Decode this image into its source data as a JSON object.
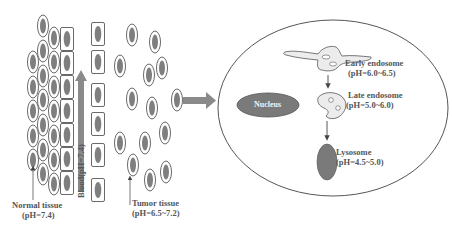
{
  "diagram": {
    "title": "",
    "colors": {
      "cell_fill": "#ffffff",
      "cell_outline": "#666666",
      "nucleus_fill": "#808080",
      "arrow_gray": "#8a8a8a",
      "organelle_fill": "#ececec",
      "lysosome_fill": "#7a7a7a",
      "text": "#555555"
    },
    "left_panel": {
      "normal_tissue": {
        "label": "Normal tissue",
        "ph": "(pH=7.4)"
      },
      "blood": {
        "label": "Blood(pH=7.4)"
      },
      "tumor_tissue": {
        "label": "Tumor tissue",
        "ph": "(pH=6.5~7.2)"
      }
    },
    "cell_panel": {
      "nucleus": {
        "label": "Nucleus"
      },
      "early_endosome": {
        "label": "Early endosome",
        "ph": "(pH=6.0~6.5)"
      },
      "late_endosome": {
        "label": "Late endosome",
        "ph": "(pH=5.0~6.0)"
      },
      "lysosome": {
        "label": "Lysosome",
        "ph": "(pH=4.5~5.0)"
      }
    },
    "flow": [
      "Normal tissue",
      "Blood",
      "Tumor tissue",
      "Cell uptake",
      "Early endosome",
      "Late endosome",
      "Lysosome"
    ]
  }
}
